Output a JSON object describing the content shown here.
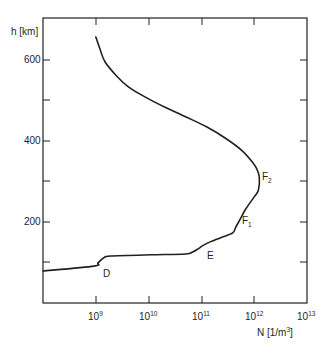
{
  "chart_data": {
    "type": "line",
    "title": "",
    "xlabel": "N [1/m³]",
    "ylabel": "h [km]",
    "xscale": "log",
    "xlim": [
      100000000.0,
      10000000000000.0
    ],
    "ylim": [
      0,
      700
    ],
    "grid": false,
    "legend": null,
    "x_ticks": [
      {
        "base": "10",
        "exp": "9",
        "value": 1000000000.0
      },
      {
        "base": "10",
        "exp": "10",
        "value": 10000000000.0
      },
      {
        "base": "10",
        "exp": "11",
        "value": 100000000000.0
      },
      {
        "base": "10",
        "exp": "12",
        "value": 1000000000000.0
      },
      {
        "base": "10",
        "exp": "13",
        "value": 10000000000000.0
      }
    ],
    "y_ticks_labeled": [
      200,
      400,
      600
    ],
    "y_ticks_minor": [
      100,
      300,
      500
    ],
    "series": [
      {
        "name": "Electron density profile",
        "points": [
          {
            "N": 100000000.0,
            "h": 79
          },
          {
            "N": 920000000.0,
            "h": 91
          },
          {
            "N": 1100000000.0,
            "h": 99
          },
          {
            "N": 1400000000.0,
            "h": 111
          },
          {
            "N": 1900000000.0,
            "h": 116
          },
          {
            "N": 11000000000.0,
            "h": 119
          },
          {
            "N": 50000000000.0,
            "h": 121
          },
          {
            "N": 68000000000.0,
            "h": 126
          },
          {
            "N": 85000000000.0,
            "h": 133
          },
          {
            "N": 110000000000.0,
            "h": 143
          },
          {
            "N": 160000000000.0,
            "h": 153
          },
          {
            "N": 250000000000.0,
            "h": 163
          },
          {
            "N": 390000000000.0,
            "h": 173
          },
          {
            "N": 450000000000.0,
            "h": 188
          },
          {
            "N": 560000000000.0,
            "h": 210
          },
          {
            "N": 690000000000.0,
            "h": 232
          },
          {
            "N": 1000000000000.0,
            "h": 262
          },
          {
            "N": 1200000000000.0,
            "h": 279
          },
          {
            "N": 1250000000000.0,
            "h": 311
          },
          {
            "N": 1100000000000.0,
            "h": 333
          },
          {
            "N": 950000000000.0,
            "h": 346
          },
          {
            "N": 600000000000.0,
            "h": 375
          },
          {
            "N": 300000000000.0,
            "h": 405
          },
          {
            "N": 125000000000.0,
            "h": 435
          },
          {
            "N": 50000000000.0,
            "h": 460
          },
          {
            "N": 20000000000.0,
            "h": 484
          },
          {
            "N": 8500000000.0,
            "h": 509
          },
          {
            "N": 4200000000.0,
            "h": 533
          },
          {
            "N": 2500000000.0,
            "h": 560
          },
          {
            "N": 1500000000.0,
            "h": 595
          },
          {
            "N": 1200000000.0,
            "h": 627
          },
          {
            "N": 1000000000.0,
            "h": 657
          }
        ]
      }
    ],
    "annotations": [
      {
        "text": "D",
        "sub": "",
        "N": 1600000000.0,
        "h": 72
      },
      {
        "text": "E",
        "sub": "",
        "N": 130000000000.0,
        "h": 120
      },
      {
        "text": "F",
        "sub": "1",
        "N": 800000000000.0,
        "h": 203
      },
      {
        "text": "F",
        "sub": "2",
        "N": 1600000000000.0,
        "h": 310
      }
    ]
  },
  "axes": {
    "y_label": "h [km]",
    "y_tick_labels": {
      "t600": "600",
      "t400": "400",
      "t200": "200"
    },
    "x_label_main": "N [1/m",
    "x_label_exp": "3",
    "x_label_close": "]",
    "x_tick_base": "10",
    "x_tick_exps": {
      "e9": "9",
      "e10": "10",
      "e11": "11",
      "e12": "12",
      "e13": "13"
    }
  },
  "layers": {
    "D": "D",
    "E": "E",
    "F": "F",
    "F1_sub": "1",
    "F2_sub": "2"
  }
}
